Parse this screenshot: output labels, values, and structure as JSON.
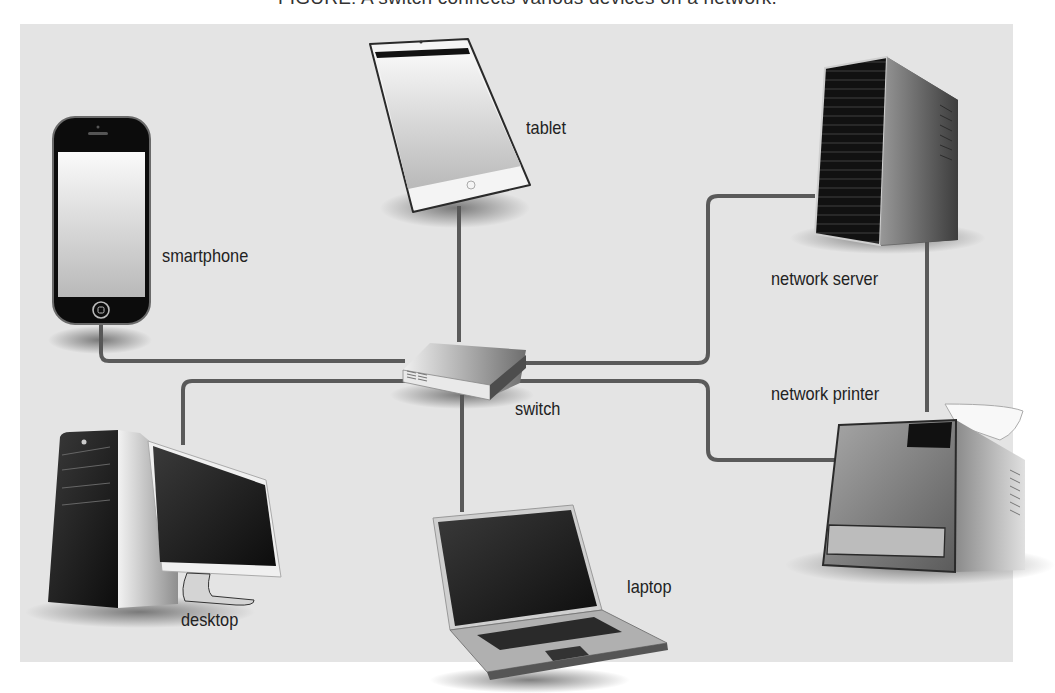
{
  "caption": "FIGURE: A switch connects various devices on a network.",
  "diagram": {
    "background_color": "#e4e4e4",
    "cable_color": "#5a5a5a",
    "hub": {
      "id": "switch",
      "label": "switch"
    },
    "devices": [
      {
        "id": "smartphone",
        "label": "smartphone",
        "icon": "smartphone-icon"
      },
      {
        "id": "tablet",
        "label": "tablet",
        "icon": "tablet-icon"
      },
      {
        "id": "network-server",
        "label": "network server",
        "icon": "server-icon"
      },
      {
        "id": "network-printer",
        "label": "network printer",
        "icon": "printer-icon"
      },
      {
        "id": "desktop",
        "label": "desktop",
        "icon": "desktop-computer-icon"
      },
      {
        "id": "laptop",
        "label": "laptop",
        "icon": "laptop-icon"
      }
    ],
    "connections": [
      {
        "from": "smartphone",
        "to": "switch"
      },
      {
        "from": "tablet",
        "to": "switch"
      },
      {
        "from": "network-server",
        "to": "switch"
      },
      {
        "from": "network-printer",
        "to": "switch"
      },
      {
        "from": "desktop",
        "to": "switch"
      },
      {
        "from": "laptop",
        "to": "switch"
      },
      {
        "from": "network-server",
        "to": "network-printer"
      }
    ]
  }
}
